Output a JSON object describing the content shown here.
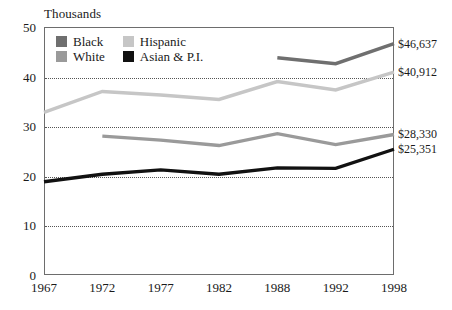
{
  "axis_unit_title": "Thousands",
  "legend": {
    "items": [
      {
        "label": "Black",
        "color": "#6f6f6f",
        "swatch_name": "legend-swatch-black"
      },
      {
        "label": "Hispanic",
        "color": "#c6c6c6",
        "swatch_name": "legend-swatch-hispanic"
      },
      {
        "label": "White",
        "color": "#9a9a9a",
        "swatch_name": "legend-swatch-white"
      },
      {
        "label": "Asian & P.I.",
        "color": "#111111",
        "swatch_name": "legend-swatch-asian-pi"
      }
    ]
  },
  "end_labels": [
    {
      "name": "end-label-black",
      "text": "$46,637",
      "value": 46.637
    },
    {
      "name": "end-label-hispanic",
      "text": "$40,912",
      "value": 40.912
    },
    {
      "name": "end-label-white",
      "text": "$28,330",
      "value": 28.33
    },
    {
      "name": "end-label-asian-pi",
      "text": "$25,351",
      "value": 25.351
    }
  ],
  "chart_data": {
    "type": "line",
    "title": "",
    "subtitle": "",
    "xlabel": "",
    "ylabel": "Thousands",
    "categories": [
      "1967",
      "1972",
      "1977",
      "1982",
      "1988",
      "1992",
      "1998"
    ],
    "x_tick_labels": [
      "1967",
      "1972",
      "1977",
      "1982",
      "1988",
      "1992",
      "1998"
    ],
    "y_tick_labels": [
      "0",
      "10",
      "20",
      "30",
      "40",
      "50"
    ],
    "y_ticks": [
      0,
      10,
      20,
      30,
      40,
      50
    ],
    "ylim": [
      0,
      50
    ],
    "grid": true,
    "gridlines_at": [
      10,
      20,
      30,
      40
    ],
    "legend_position": "inside-top-left",
    "series": [
      {
        "name": "Black",
        "color": "#6f6f6f",
        "values": [
          null,
          null,
          null,
          null,
          43.8,
          42.6,
          46.637
        ]
      },
      {
        "name": "Hispanic",
        "color": "#c6c6c6",
        "values": [
          32.8,
          37.0,
          36.3,
          35.4,
          39.0,
          37.3,
          40.912
        ]
      },
      {
        "name": "White",
        "color": "#9a9a9a",
        "values": [
          null,
          28.0,
          27.2,
          26.1,
          28.5,
          26.3,
          28.33
        ]
      },
      {
        "name": "Asian & P.I.",
        "color": "#111111",
        "values": [
          18.8,
          20.3,
          21.2,
          20.3,
          21.6,
          21.5,
          25.351
        ]
      }
    ]
  }
}
